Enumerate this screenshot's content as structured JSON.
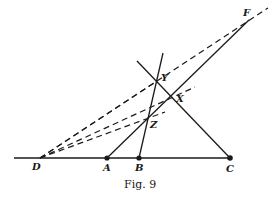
{
  "figure": {
    "caption": "Fig. 9",
    "colors": {
      "ink": "#1a1a1a",
      "background": "#ffffff"
    }
  },
  "points": {
    "D": {
      "label": "D",
      "x": 40,
      "y": 158
    },
    "A": {
      "label": "A",
      "x": 107,
      "y": 158
    },
    "B": {
      "label": "B",
      "x": 139,
      "y": 158
    },
    "C": {
      "label": "C",
      "x": 230,
      "y": 158
    },
    "F": {
      "label": "F",
      "x": 249,
      "y": 20
    },
    "Y": {
      "label": "Y",
      "x": 157,
      "y": 81
    },
    "X": {
      "label": "X",
      "x": 171,
      "y": 97
    },
    "Z": {
      "label": "Z",
      "x": 147,
      "y": 120
    }
  },
  "lines": {
    "solid": [
      "base line through D, A, B, C",
      "A to F",
      "B through Z and Y",
      "C through X and Y"
    ],
    "dashed": [
      "D to F (extended)",
      "D through Y to X side",
      "D through X (extended)",
      "D through Z (extended)"
    ]
  }
}
